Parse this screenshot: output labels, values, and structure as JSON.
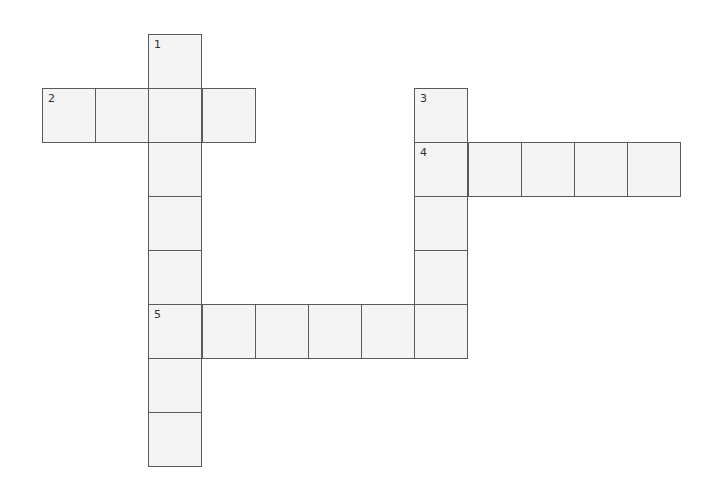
{
  "puzzle": {
    "type": "crossword",
    "cell_size": [
      53.2,
      54
    ],
    "origin": [
      42,
      34
    ],
    "colors": {
      "cell_fill": "#f4f4f4",
      "cell_border": "#5a5a5a",
      "background": "#ffffff"
    },
    "clues": [
      {
        "number": "1",
        "direction": "down",
        "col": 2,
        "row": 0,
        "length": 8
      },
      {
        "number": "2",
        "direction": "across",
        "col": 0,
        "row": 1,
        "length": 4
      },
      {
        "number": "3",
        "direction": "down",
        "col": 7,
        "row": 1,
        "length": 5
      },
      {
        "number": "4",
        "direction": "across",
        "col": 7,
        "row": 2,
        "length": 5
      },
      {
        "number": "5",
        "direction": "across",
        "col": 2,
        "row": 5,
        "length": 6
      }
    ]
  }
}
